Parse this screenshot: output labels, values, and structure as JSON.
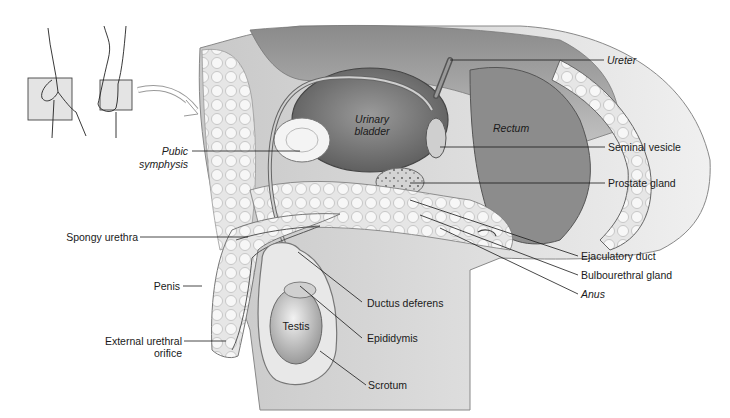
{
  "diagram": {
    "type": "anatomical-cross-section",
    "palette": {
      "ink": "#1a1a1a",
      "tissue_dark": "#6e6e6e",
      "tissue_mid": "#a8a8a8",
      "tissue_light": "#d9d9d9",
      "background": "#ffffff"
    },
    "orientation_inset": {
      "description": "Two hands holding a plane; curved arrow pointing to section view",
      "icon": "orientation-arrow-icon"
    },
    "labels": {
      "ureter": "Ureter",
      "urinary_bladder_line1": "Urinary",
      "urinary_bladder_line2": "bladder",
      "rectum": "Rectum",
      "pubic_symphysis_line1": "Pubic",
      "pubic_symphysis_line2": "symphysis",
      "seminal_vesicle": "Seminal vesicle",
      "prostate_gland": "Prostate gland",
      "spongy_urethra": "Spongy urethra",
      "ejaculatory_duct": "Ejaculatory duct",
      "bulbourethral_gland": "Bulbourethral gland",
      "anus": "Anus",
      "penis": "Penis",
      "ductus_deferens": "Ductus deferens",
      "testis": "Testis",
      "epididymis": "Epididymis",
      "external_urethral_orifice_line1": "External urethral",
      "external_urethral_orifice_line2": "orifice",
      "scrotum": "Scrotum"
    }
  }
}
